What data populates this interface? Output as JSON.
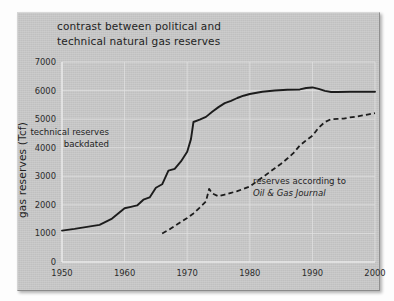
{
  "chart_data": {
    "type": "line",
    "title_line1": "contrast between political and",
    "title_line2": "technical natural gas reserves",
    "xlabel": "",
    "ylabel": "gas reserves (Tcf)",
    "xlim": [
      1950,
      2000
    ],
    "ylim": [
      0,
      7000
    ],
    "xticks": [
      1950,
      1960,
      1970,
      1980,
      1990,
      2000
    ],
    "xtick_labels": [
      "1950",
      "1960",
      "1970",
      "1980",
      "1990",
      "2000"
    ],
    "yticks": [
      0,
      1000,
      2000,
      3000,
      4000,
      5000,
      6000,
      7000
    ],
    "ytick_labels": [
      "0",
      "1000",
      "2000",
      "3000",
      "4000",
      "5000",
      "6000",
      "7000"
    ],
    "grid": true,
    "legend_position": "inline-annotations",
    "annotations": [
      {
        "name": "technical-reserves-label",
        "line1": "technical reserves",
        "line2": "backdated",
        "x": 1957.5,
        "y": 4450,
        "align": "end",
        "italic_line2": false
      },
      {
        "name": "oil-gas-journal-label",
        "line1": "reserves according to",
        "line2": "Oil & Gas Journal",
        "x": 1980.5,
        "y": 2720,
        "align": "start",
        "italic_line2": true
      }
    ],
    "series": [
      {
        "name": "technical reserves backdated",
        "style": "solid",
        "color": "#1c1c1c",
        "x": [
          1950,
          1952,
          1954,
          1956,
          1958,
          1960,
          1961,
          1962,
          1963,
          1964,
          1965,
          1966,
          1967,
          1968,
          1969,
          1970,
          1970.6,
          1971,
          1972,
          1973,
          1974,
          1975,
          1976,
          1977,
          1978,
          1979,
          1980,
          1982,
          1984,
          1986,
          1988,
          1989,
          1990,
          1991,
          1992,
          1993,
          1994,
          1996,
          1998,
          2000
        ],
        "values": [
          1100,
          1160,
          1230,
          1300,
          1520,
          1880,
          1930,
          1980,
          2180,
          2260,
          2600,
          2720,
          3200,
          3260,
          3520,
          3860,
          4300,
          4900,
          4980,
          5080,
          5260,
          5420,
          5560,
          5640,
          5740,
          5820,
          5880,
          5960,
          6000,
          6030,
          6040,
          6090,
          6110,
          6060,
          5990,
          5950,
          5950,
          5960,
          5960,
          5960
        ]
      },
      {
        "name": "reserves according to Oil & Gas Journal",
        "style": "dashed",
        "color": "#1c1c1c",
        "x": [
          1966,
          1967,
          1968,
          1969,
          1970,
          1971,
          1972,
          1973,
          1973.5,
          1974,
          1975,
          1976,
          1977,
          1978,
          1979,
          1980,
          1981,
          1982,
          1983,
          1984,
          1985,
          1986,
          1987,
          1988,
          1989,
          1990,
          1991,
          1992,
          1993,
          1994,
          1995,
          1996,
          1997,
          1998,
          1999,
          2000
        ],
        "values": [
          1000,
          1120,
          1260,
          1400,
          1540,
          1700,
          1900,
          2120,
          2560,
          2400,
          2300,
          2360,
          2420,
          2480,
          2560,
          2640,
          2800,
          2960,
          3120,
          3280,
          3440,
          3620,
          3820,
          4080,
          4260,
          4420,
          4700,
          4900,
          5000,
          5010,
          5020,
          5060,
          5090,
          5130,
          5170,
          5210
        ]
      }
    ]
  }
}
